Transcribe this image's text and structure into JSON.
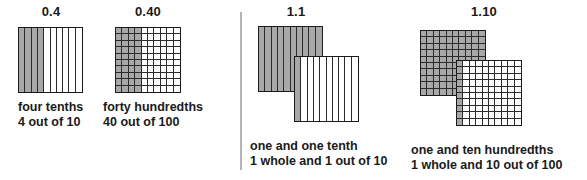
{
  "figure": {
    "divider_color": "#b4b4b4",
    "shade_color": "#a8a8a8",
    "line_color": "#1a1a1a"
  },
  "models": [
    {
      "id": "four-tenths",
      "heading": "0.4",
      "caption_line1": "four tenths",
      "caption_line2": "4 out of 10",
      "grid_type": "tenths",
      "columns": 10,
      "rows": 1,
      "shaded_units": 4,
      "total_units": 10,
      "wholes": 0
    },
    {
      "id": "forty-hundredths",
      "heading": "0.40",
      "caption_line1": "forty hundredths",
      "caption_line2": "40 out of 100",
      "grid_type": "hundredths",
      "columns": 10,
      "rows": 10,
      "shaded_units": 40,
      "total_units": 100,
      "wholes": 0
    },
    {
      "id": "one-and-one-tenth",
      "heading": "1.1",
      "caption_line1": "one and one tenth",
      "caption_line2": "1 whole and 1 out of 10",
      "grid_type": "tenths",
      "columns": 10,
      "rows": 1,
      "shaded_units": 1,
      "total_units": 10,
      "wholes": 1
    },
    {
      "id": "one-and-ten-hundredths",
      "heading": "1.10",
      "caption_line1": "one and ten hundredths",
      "caption_line2": "1 whole and 10 out of 100",
      "grid_type": "hundredths",
      "columns": 10,
      "rows": 10,
      "shaded_units": 10,
      "total_units": 100,
      "wholes": 1
    }
  ]
}
